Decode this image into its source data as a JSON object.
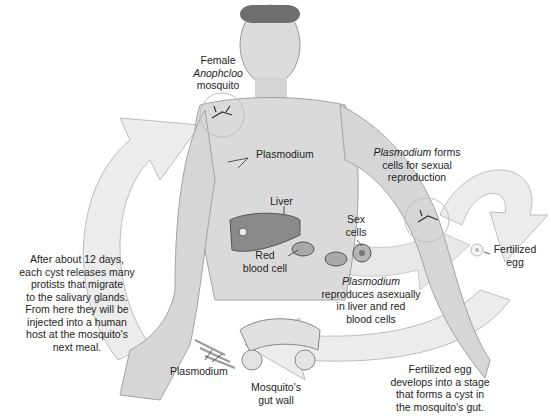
{
  "diagram": {
    "type": "life-cycle",
    "colors": {
      "arrow_fill": "#ececec",
      "arrow_stroke": "#bdbdbd",
      "skin": "#d9d9d9",
      "skin_shade": "#b8b8b8",
      "liver": "#8a8a8a",
      "text": "#1e1e1e",
      "background": "#ffffff"
    },
    "labels": {
      "mosquito": {
        "line1": "Female",
        "line2_italic": "Anophcloo",
        "line3": "mosquito"
      },
      "plasmodium_arm": "Plasmodium",
      "sexual": {
        "italic": "Plasmodium",
        "line1_rest": " forms",
        "line2": "cells for sexual",
        "line3": "reproduction"
      },
      "liver": "Liver",
      "red_blood_cell": {
        "line1": "Red",
        "line2": "blood cell"
      },
      "sex_cells": {
        "line1": "Sex",
        "line2": "cells"
      },
      "fertilized_egg": {
        "line1": "Fertilized",
        "line2": "egg"
      },
      "asexual": {
        "italic": "Plasmodium",
        "line2": "reproduces asexually",
        "line3": "in liver and red",
        "line4": "blood cells"
      },
      "cyst_release": {
        "lines": [
          "After about 12 days,",
          "each cyst releases many",
          "protists that migrate",
          "to the salivary glands.",
          "From here they will be",
          "injected into a human",
          "host at the mosquito's",
          "next meal."
        ]
      },
      "plasmodium_gut": "Plasmodium",
      "gut_wall": {
        "line1": "Mosquito's",
        "line2": "gut wall"
      },
      "cyst_stage": {
        "line1": "Fertilized egg",
        "line2": "develops into a stage",
        "line3": "that forms a cyst in",
        "line4": "the mosquito's gut."
      }
    }
  }
}
